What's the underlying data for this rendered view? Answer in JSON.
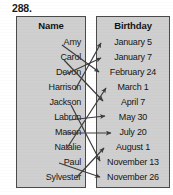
{
  "problem": {
    "number": "288."
  },
  "columns": {
    "left": {
      "header": "Name",
      "items": [
        {
          "label": "Amy",
          "y": 42
        },
        {
          "label": "Carol",
          "y": 57
        },
        {
          "label": "Devon",
          "y": 72
        },
        {
          "label": "Harrison",
          "y": 87
        },
        {
          "label": "Jackson",
          "y": 102
        },
        {
          "label": "Labron",
          "y": 117
        },
        {
          "label": "Mason",
          "y": 132
        },
        {
          "label": "Natalie",
          "y": 147
        },
        {
          "label": "Paul",
          "y": 162
        },
        {
          "label": "Sylvester",
          "y": 177
        }
      ]
    },
    "right": {
      "header": "Birthday",
      "items": [
        {
          "label": "January 5",
          "y": 42
        },
        {
          "label": "January 7",
          "y": 57
        },
        {
          "label": "February 24",
          "y": 72
        },
        {
          "label": "March 1",
          "y": 87
        },
        {
          "label": "April 7",
          "y": 102
        },
        {
          "label": "May 30",
          "y": 117
        },
        {
          "label": "July 20",
          "y": 132
        },
        {
          "label": "August 1",
          "y": 147
        },
        {
          "label": "November 13",
          "y": 162
        },
        {
          "label": "November 26",
          "y": 177
        }
      ]
    }
  },
  "matching_lines": [
    {
      "from": "Amy",
      "to": "February 24",
      "x1": 62,
      "y1": 45,
      "x2": 99,
      "y2": 72
    },
    {
      "from": "Carol",
      "to": "April 7",
      "x1": 64,
      "y1": 60,
      "x2": 103,
      "y2": 101
    },
    {
      "from": "Devon",
      "to": "January 7",
      "x1": 64,
      "y1": 75,
      "x2": 101,
      "y2": 58
    },
    {
      "from": "Harrison",
      "to": "January 5",
      "x1": 75,
      "y1": 90,
      "x2": 101,
      "y2": 43
    },
    {
      "from": "Jackson",
      "to": "November 13",
      "x1": 71,
      "y1": 105,
      "x2": 100,
      "y2": 161
    },
    {
      "from": "Labron",
      "to": "May 30",
      "x1": 69,
      "y1": 120,
      "x2": 105,
      "y2": 116
    },
    {
      "from": "Mason",
      "to": "July 20",
      "x1": 66,
      "y1": 133,
      "x2": 111,
      "y2": 133
    },
    {
      "from": "Natalie",
      "to": "March 1",
      "x1": 67,
      "y1": 148,
      "x2": 106,
      "y2": 88
    },
    {
      "from": "Paul",
      "to": "November 26",
      "x1": 59,
      "y1": 163,
      "x2": 100,
      "y2": 177
    },
    {
      "from": "Sylvester",
      "to": "August 1",
      "x1": 76,
      "y1": 178,
      "x2": 104,
      "y2": 148
    }
  ],
  "colors": {
    "box_fill": "#cfcfcf",
    "box_border": "#4a4a4a",
    "text": "#161616",
    "line": "#3c3c3c"
  }
}
